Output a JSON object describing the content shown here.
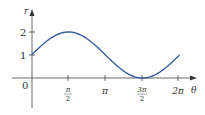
{
  "chart_data": {
    "type": "line",
    "title": "",
    "function": "r = 1 + sin(theta)",
    "xlabel": "θ",
    "ylabel": "r",
    "x_ticks": [
      {
        "value": 0,
        "label": "0"
      },
      {
        "value": 1.5708,
        "label_num": "π",
        "label_den": "2"
      },
      {
        "value": 3.1416,
        "label": "π"
      },
      {
        "value": 4.7124,
        "label_num": "3π",
        "label_den": "2"
      },
      {
        "value": 6.2832,
        "label": "2π"
      }
    ],
    "y_ticks": [
      {
        "value": 1,
        "label": "1"
      },
      {
        "value": 2,
        "label": "2"
      }
    ],
    "x": [
      0,
      0.7854,
      1.5708,
      2.3562,
      3.1416,
      3.927,
      4.7124,
      5.4978,
      6.2832
    ],
    "series": [
      {
        "name": "r",
        "values": [
          1,
          1.707,
          2,
          1.707,
          1,
          0.293,
          0,
          0.293,
          1
        ],
        "color": "#3a5fa0"
      }
    ],
    "xlim": [
      0,
      6.2832
    ],
    "ylim": [
      0,
      2
    ],
    "grid": false,
    "legend": "none"
  },
  "labels": {
    "origin": "0",
    "y_axis": "r",
    "x_axis": "θ",
    "y1": "1",
    "y2": "2",
    "pi_half_num": "π",
    "pi_half_den": "2",
    "pi": "π",
    "three_pi_half_num": "3π",
    "three_pi_half_den": "2",
    "two_pi": "2π"
  }
}
